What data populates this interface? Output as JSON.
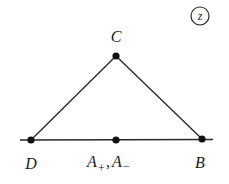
{
  "badge": {
    "label": "z"
  },
  "points": {
    "C": {
      "label": "C",
      "x": 116,
      "y": 56
    },
    "D": {
      "label": "D",
      "x": 31,
      "y": 140
    },
    "A": {
      "label_main": "A",
      "sub_plus": "+",
      "sep": ",",
      "label_main2": "A",
      "sub_minus": "−",
      "x": 116,
      "y": 140
    },
    "B": {
      "label": "B",
      "x": 202,
      "y": 139
    }
  },
  "line": {
    "x1": 20,
    "x2": 213,
    "y": 140
  },
  "colors": {
    "stroke": "#2a2a2a",
    "point": "#111111",
    "text": "#1a1a1a",
    "background": "#ffffff"
  }
}
